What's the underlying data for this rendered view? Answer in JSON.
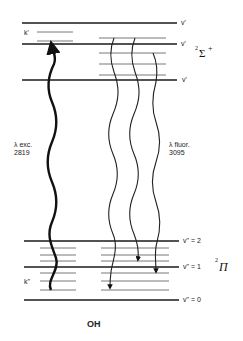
{
  "diagram": {
    "molecule": "OH",
    "upper_state": {
      "term_symbol": "²Σ⁺",
      "term_superscript": "2",
      "term_letter": "Σ",
      "term_suffix": "+",
      "levels": [
        {
          "label": "v'"
        },
        {
          "label": "v'"
        },
        {
          "label": "v'"
        }
      ],
      "rotational_label": "k'"
    },
    "lower_state": {
      "term_symbol": "²Π",
      "term_superscript": "2",
      "term_letter": "Π",
      "levels": [
        {
          "label": "v\" = 2"
        },
        {
          "label": "v\" = 1"
        },
        {
          "label": "v\" = 0"
        }
      ],
      "rotational_label": "k\""
    },
    "excitation": {
      "label_line1": "λ exc.",
      "label_line2": "2819"
    },
    "fluorescence": {
      "label_line1": "λ fluor.",
      "label_line2": "3095"
    },
    "colors": {
      "line": "#1a1a1a",
      "sublevel": "#555555",
      "background": "#ffffff"
    }
  }
}
